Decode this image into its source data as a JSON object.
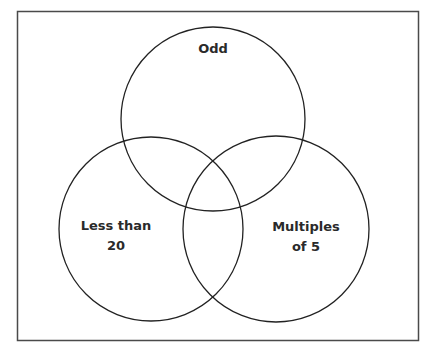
{
  "diagram": {
    "type": "venn",
    "set_count": 3,
    "sets": [
      {
        "id": "odd",
        "label_lines": [
          "Odd"
        ]
      },
      {
        "id": "less-than-20",
        "label_lines": [
          "Less than",
          "20"
        ]
      },
      {
        "id": "multiples-of-5",
        "label_lines": [
          "Multiples",
          "of 5"
        ]
      }
    ],
    "colors": {
      "stroke": "#222222",
      "frame": "#4a4a4a",
      "text": "#2a2a2a",
      "background": "#ffffff"
    }
  }
}
